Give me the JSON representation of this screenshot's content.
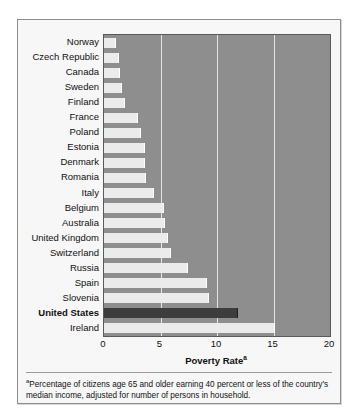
{
  "chart_data": {
    "type": "bar",
    "orientation": "horizontal",
    "title": "",
    "xlabel": "Poverty Rate",
    "xlabel_superscript": "a",
    "ylabel": "",
    "xlim": [
      0,
      20
    ],
    "xticks": [
      0,
      5,
      10,
      15,
      20
    ],
    "grid": true,
    "legend": null,
    "highlight_category": "United States",
    "categories": [
      "Norway",
      "Czech Republic",
      "Canada",
      "Sweden",
      "Finland",
      "France",
      "Poland",
      "Estonia",
      "Denmark",
      "Romania",
      "Italy",
      "Belgium",
      "Australia",
      "United Kingdom",
      "Switzerland",
      "Russia",
      "Spain",
      "Slovenia",
      "United States",
      "Ireland"
    ],
    "values": [
      1.1,
      1.3,
      1.4,
      1.6,
      1.9,
      3.0,
      3.3,
      3.6,
      3.6,
      3.7,
      4.4,
      5.3,
      5.4,
      5.7,
      5.9,
      7.4,
      9.1,
      9.3,
      11.9,
      15.1
    ],
    "colors": {
      "bar": "#ebebeb",
      "highlight_bar": "#3d3d3d",
      "plot_background": "#8e8e8e",
      "gridline": "#e4e4e4",
      "figure_background": "#f7f7f7",
      "text": "#111111"
    }
  },
  "footnote": {
    "marker": "a",
    "text": "Percentage of citizens age 65 and older earning 40 percent or less of the country's median income, adjusted for number of persons in household."
  }
}
